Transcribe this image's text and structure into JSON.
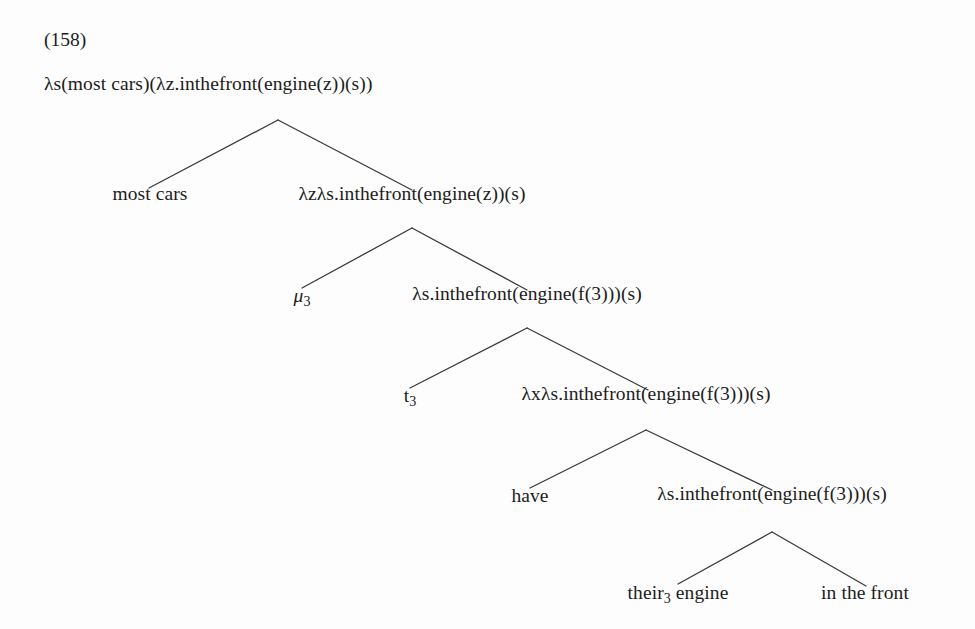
{
  "document": {
    "example_number": "(158)",
    "background_color": "#fdfdfd",
    "text_color": "#1c1c1c",
    "line_color": "#3a3a3a"
  },
  "tree": {
    "nodes": [
      {
        "id": "root",
        "label": "λs(most cars)(λz.inthefront(engine(z))(s))",
        "level": 0,
        "x": 44,
        "y": 88,
        "align": "left"
      },
      {
        "id": "l1-left",
        "label": "most cars",
        "level": 1,
        "x": 150,
        "y": 198,
        "align": "center"
      },
      {
        "id": "l1-right",
        "label": "λzλs.inthefront(engine(z))(s)",
        "level": 1,
        "x": 412,
        "y": 198,
        "align": "center"
      },
      {
        "id": "l2-left",
        "label": "μ₃",
        "label_base": "μ",
        "label_sub": "3",
        "level": 2,
        "x": 302,
        "y": 300,
        "align": "center"
      },
      {
        "id": "l2-right",
        "label": "λs.inthefront(engine(f(3)))(s)",
        "level": 2,
        "x": 527,
        "y": 298,
        "align": "center"
      },
      {
        "id": "l3-left",
        "label": "t₃",
        "label_base": "t",
        "label_sub": "3",
        "level": 3,
        "x": 410,
        "y": 400,
        "align": "center"
      },
      {
        "id": "l3-right",
        "label": "λxλs.inthefront(engine(f(3)))(s)",
        "level": 3,
        "x": 646,
        "y": 398,
        "align": "center"
      },
      {
        "id": "l4-left",
        "label": "have",
        "level": 4,
        "x": 530,
        "y": 500,
        "align": "center"
      },
      {
        "id": "l4-right",
        "label": "λs.inthefront(engine(f(3)))(s)",
        "level": 4,
        "x": 772,
        "y": 498,
        "align": "center"
      },
      {
        "id": "l5-left",
        "label": "their₃ engine",
        "label_base": "their",
        "label_sub": "3",
        "label_rest": " engine",
        "level": 5,
        "x": 678,
        "y": 597,
        "align": "center"
      },
      {
        "id": "l5-right",
        "label": "in the front",
        "level": 5,
        "x": 865,
        "y": 597,
        "align": "center"
      }
    ],
    "branches": [
      {
        "id": "b1",
        "from_x": 278,
        "from_y": 120,
        "to_left_x": 149,
        "to_left_y": 188,
        "to_right_x": 412,
        "to_right_y": 190
      },
      {
        "id": "b2",
        "from_x": 412,
        "from_y": 228,
        "to_left_x": 302,
        "to_left_y": 288,
        "to_right_x": 527,
        "to_right_y": 290
      },
      {
        "id": "b3",
        "from_x": 527,
        "from_y": 328,
        "to_left_x": 410,
        "to_left_y": 388,
        "to_right_x": 648,
        "to_right_y": 390
      },
      {
        "id": "b4",
        "from_x": 646,
        "from_y": 430,
        "to_left_x": 530,
        "to_left_y": 488,
        "to_right_x": 772,
        "to_right_y": 490
      },
      {
        "id": "b5",
        "from_x": 772,
        "from_y": 532,
        "to_left_x": 678,
        "to_left_y": 584,
        "to_right_x": 866,
        "to_right_y": 586
      }
    ]
  }
}
